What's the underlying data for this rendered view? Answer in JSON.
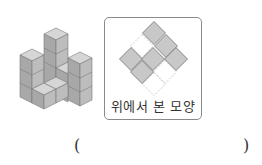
{
  "figure": {
    "left_image": "isometric-cube-stack",
    "top_view_frame": {
      "caption": "위에서 본 모양",
      "border_color": "#8a8a8a",
      "cell_fill": "#c8c8c8",
      "cell_stroke": "#6e6e6e",
      "dashed_stroke": "#bdbdbd",
      "filled_cells": [
        {
          "cx": 49,
          "cy": 15
        },
        {
          "cx": 61,
          "cy": 28
        },
        {
          "cx": 26,
          "cy": 41
        },
        {
          "cx": 48,
          "cy": 41
        },
        {
          "cx": 71,
          "cy": 41
        },
        {
          "cx": 37,
          "cy": 54
        }
      ],
      "dashed_cells": [
        {
          "cx": 37,
          "cy": 28
        },
        {
          "cx": 60,
          "cy": 54
        },
        {
          "cx": 49,
          "cy": 66
        }
      ]
    }
  },
  "answer": {
    "open_paren": "(",
    "close_paren": ")",
    "value": ""
  }
}
